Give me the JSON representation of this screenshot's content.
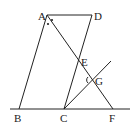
{
  "diagram": {
    "type": "geometry",
    "points": {
      "A": {
        "label": "A",
        "x": 47,
        "y": 15
      },
      "D": {
        "label": "D",
        "x": 92,
        "y": 15
      },
      "B": {
        "label": "B",
        "x": 19,
        "y": 109
      },
      "C": {
        "label": "C",
        "x": 64,
        "y": 109
      },
      "F": {
        "label": "F",
        "x": 113,
        "y": 109
      },
      "E": {
        "label": "E",
        "x": 78,
        "y": 60
      },
      "G": {
        "label": "G",
        "x": 92,
        "y": 80
      }
    },
    "segments": [
      [
        "A",
        "D"
      ],
      [
        "A",
        "B"
      ],
      [
        "D",
        "C"
      ],
      [
        "A",
        "F"
      ],
      [
        "C",
        "G"
      ]
    ],
    "baseline": {
      "x1": 10,
      "x2": 130,
      "y": 109
    },
    "ray_end": {
      "x": 111,
      "y": 61
    },
    "angle_marks": [
      "angle-BAF",
      "angle-DAF",
      "angle-CGF"
    ]
  }
}
